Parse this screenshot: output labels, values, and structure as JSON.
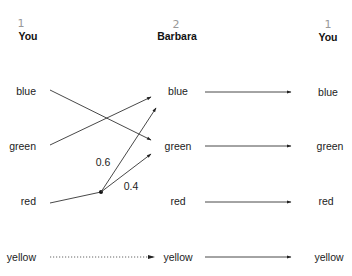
{
  "columns": [
    {
      "header": "You",
      "step_mark": "1"
    },
    {
      "header": "Barbara",
      "step_mark": "2"
    },
    {
      "header": "You",
      "step_mark": "1"
    }
  ],
  "rows": [
    "blue",
    "green",
    "red",
    "yellow"
  ],
  "left_to_middle": [
    {
      "from": "blue",
      "to": "green",
      "style": "solid"
    },
    {
      "from": "green",
      "to": "blue",
      "style": "solid"
    },
    {
      "from": "red",
      "to": "blue",
      "style": "solid",
      "probability": "0.6"
    },
    {
      "from": "red",
      "to": "green",
      "style": "solid",
      "probability": "0.4"
    },
    {
      "from": "yellow",
      "to": "yellow",
      "style": "dotted"
    }
  ],
  "middle_to_right": [
    {
      "from": "blue",
      "to": "blue"
    },
    {
      "from": "green",
      "to": "green"
    },
    {
      "from": "red",
      "to": "red"
    },
    {
      "from": "yellow",
      "to": "yellow"
    }
  ],
  "probabilities": {
    "upper": "0.6",
    "lower": "0.4"
  }
}
